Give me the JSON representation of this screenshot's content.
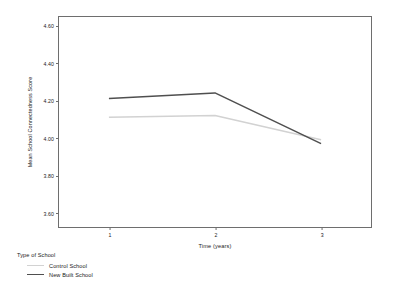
{
  "chart_data": {
    "type": "line",
    "title": "",
    "xlabel": "Time (years)",
    "ylabel": "Mean School Connectedness Score",
    "x": [
      1,
      2,
      3
    ],
    "categories": [
      "1",
      "2",
      "3"
    ],
    "xtick_labels": [
      "1",
      "2",
      "3"
    ],
    "ytick_labels": [
      "4.60",
      "4.40",
      "4.20",
      "4.00",
      "3.80",
      "3.60"
    ],
    "ytick_values": [
      4.6,
      4.4,
      4.2,
      4.0,
      3.8,
      3.6
    ],
    "ylim": [
      3.52,
      4.65
    ],
    "xlim": [
      0.52,
      3.48
    ],
    "grid": false,
    "legend_position": "below-left",
    "legend_title": "Type of School",
    "series": [
      {
        "name": "Control School",
        "values": [
          4.11,
          4.12,
          3.99
        ],
        "color": "#d2d2d2"
      },
      {
        "name": "New Built School",
        "values": [
          4.21,
          4.24,
          3.97
        ],
        "color": "#4f4f4f"
      }
    ]
  },
  "axis_colors": {
    "frame": "#6e6e6e",
    "text": "#1a1a1a",
    "background": "#ffffff"
  }
}
